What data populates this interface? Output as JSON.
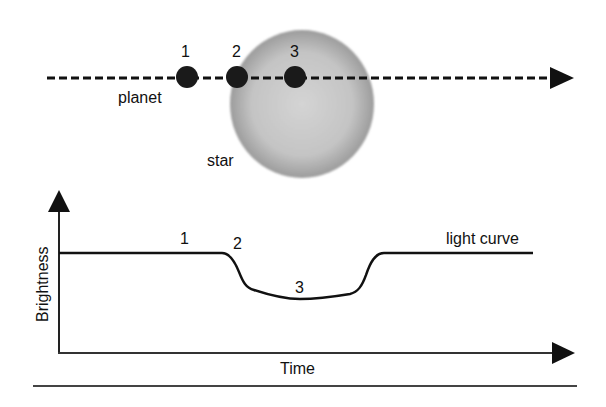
{
  "diagram": {
    "top_panel": {
      "labels": {
        "planet": "planet",
        "star": "star"
      },
      "planet_positions": [
        {
          "label": "1",
          "x": 187
        },
        {
          "label": "2",
          "x": 237
        },
        {
          "label": "3",
          "x": 295
        }
      ],
      "path_direction": "left-to-right arrow"
    },
    "bottom_panel": {
      "y_axis_label": "Brightness",
      "x_axis_label": "Time",
      "curve_label": "light curve",
      "point_labels": [
        "1",
        "2",
        "3"
      ]
    },
    "colors": {
      "ink": "#111111",
      "star_center": "#d2d2d2",
      "star_edge": "#9a9a9a",
      "planet": "#1a1a1a"
    }
  }
}
